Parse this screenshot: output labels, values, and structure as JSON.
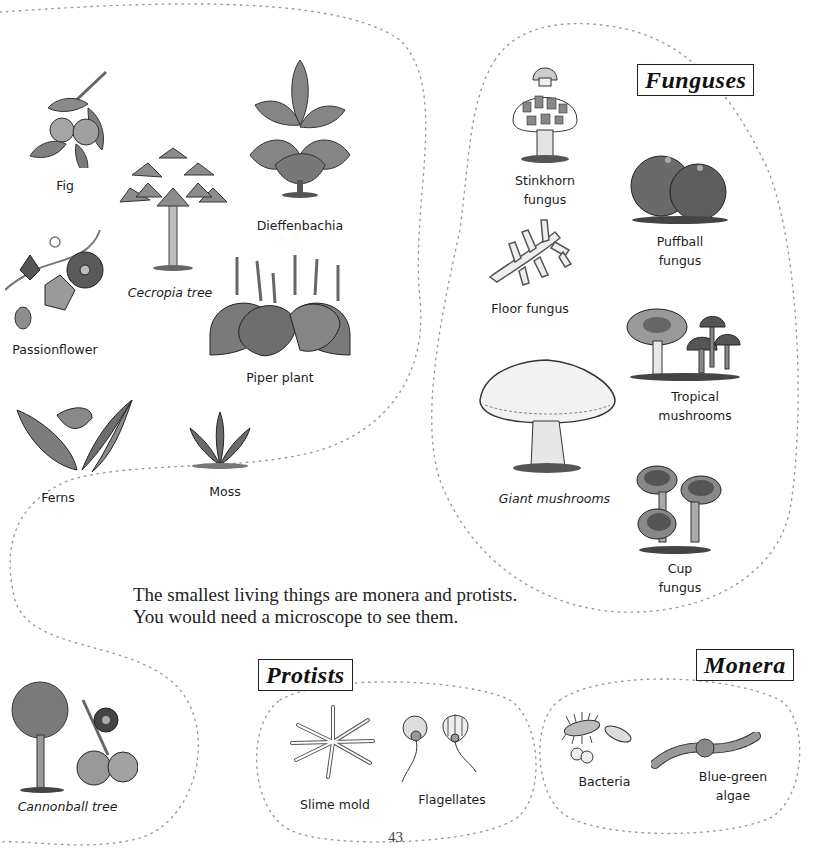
{
  "page": {
    "page_number": "43",
    "intro_text_line1": "The smallest living things are monera and protists.",
    "intro_text_line2": "You would need a microscope to see them."
  },
  "plants": {
    "items": [
      {
        "label": "Fig"
      },
      {
        "label": "Cecropia tree"
      },
      {
        "label": "Dieffenbachia"
      },
      {
        "label": "Passionflower"
      },
      {
        "label": "Piper plant"
      },
      {
        "label": "Ferns"
      },
      {
        "label": "Moss"
      },
      {
        "label": "Cannonball tree"
      }
    ]
  },
  "funguses": {
    "title": "Funguses",
    "items": [
      {
        "label_line1": "Stinkhorn",
        "label_line2": "fungus"
      },
      {
        "label_line1": "Puffball",
        "label_line2": "fungus"
      },
      {
        "label_line1": "Floor fungus"
      },
      {
        "label_line1": "Tropical",
        "label_line2": "mushrooms"
      },
      {
        "label_line1": "Giant mushrooms"
      },
      {
        "label_line1": "Cup",
        "label_line2": "fungus"
      }
    ]
  },
  "protists": {
    "title": "Protists",
    "items": [
      {
        "label": "Slime mold"
      },
      {
        "label": "Flagellates"
      }
    ]
  },
  "monera": {
    "title": "Monera",
    "items": [
      {
        "label_line1": "Bacteria"
      },
      {
        "label_line1": "Blue-green",
        "label_line2": "algae"
      }
    ]
  }
}
